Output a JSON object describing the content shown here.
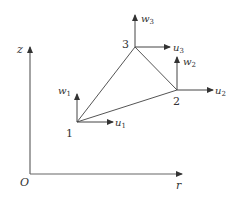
{
  "axes": {
    "vertical_label": "z",
    "horizontal_label": "r",
    "origin_label": "O"
  },
  "nodes": [
    {
      "id": "1",
      "label": "1",
      "u_label": "u",
      "u_sub": "1",
      "w_label": "w",
      "w_sub": "1"
    },
    {
      "id": "2",
      "label": "2",
      "u_label": "u",
      "u_sub": "2",
      "w_label": "w",
      "w_sub": "2"
    },
    {
      "id": "3",
      "label": "3",
      "u_label": "u",
      "u_sub": "3",
      "w_label": "w",
      "w_sub": "3"
    }
  ],
  "colors": {
    "line": "#555555",
    "text": "#333333",
    "background": "#ffffff"
  }
}
